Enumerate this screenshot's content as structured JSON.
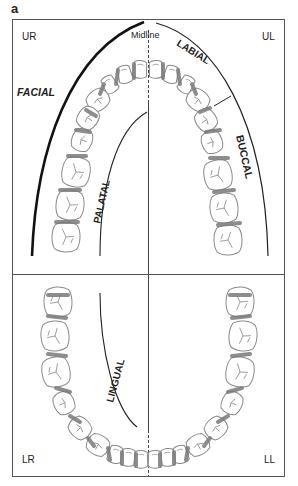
{
  "figure": {
    "panel_label": "a",
    "quadrants": {
      "upper_right": "UR",
      "upper_left": "UL",
      "lower_right": "LR",
      "lower_left": "LL"
    },
    "midline_label": "Midline",
    "surface_labels": {
      "facial": "FACIAL",
      "labial": "LABIAL",
      "buccal": "BUCCAL",
      "palatal": "PALATAL",
      "lingual": "LINGUAL"
    },
    "colors": {
      "outline": "#555555",
      "contact_area": "#7a7a7a",
      "tooth_fill": "#ffffff",
      "tooth_stroke": "#8a8a8a",
      "text": "#222222"
    }
  }
}
